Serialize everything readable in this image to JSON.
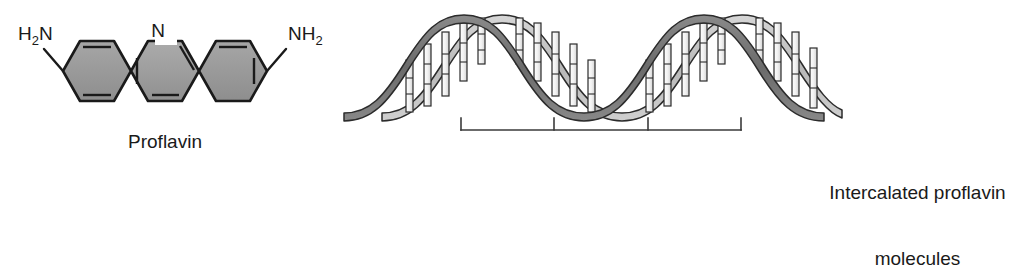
{
  "figure": {
    "type": "scientific-illustration"
  },
  "proflavin_panel": {
    "caption": "Proflavin",
    "labels": {
      "amine_left_main": "H",
      "amine_left_sub": "2",
      "amine_left_tail": "N",
      "amine_right_main": "NH",
      "amine_right_sub": "2",
      "nitrogen": "N"
    },
    "colors": {
      "ring_fill": "#9a9a9a",
      "ring_fill_light": "#b0b0b0",
      "ring_stroke": "#1a1a1a",
      "bond": "#1a1a1a",
      "text": "#1a1a1a"
    }
  },
  "dna_panel": {
    "caption_line1": "Intercalated proflavin",
    "caption_line2": "molecules",
    "colors": {
      "strand_dark": "#6e6e6e",
      "strand_light": "#c2c2c2",
      "strand_outline": "#2b2b2b",
      "rung_fill": "#f2f2f2",
      "rung_stroke": "#2b2b2b",
      "bracket": "#3a3a3a"
    },
    "bracket": {
      "tick_count": 4,
      "label": "intercalation-region-bracket"
    }
  }
}
